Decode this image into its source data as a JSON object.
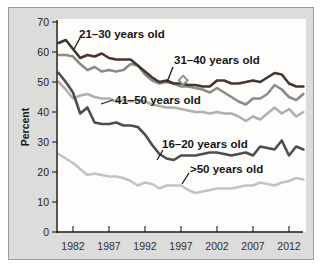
{
  "chart_data": {
    "type": "line",
    "ylabel": "Percent",
    "xlabel": "",
    "xlim": [
      1980,
      2014
    ],
    "ylim": [
      0,
      70
    ],
    "grid": false,
    "legend_position": "inline-annotations",
    "x": [
      1980,
      1981,
      1982,
      1983,
      1984,
      1985,
      1986,
      1987,
      1988,
      1989,
      1990,
      1991,
      1992,
      1993,
      1994,
      1995,
      1996,
      1997,
      1998,
      1999,
      2000,
      2001,
      2002,
      2003,
      2004,
      2005,
      2006,
      2007,
      2008,
      2009,
      2010,
      2011,
      2012,
      2013,
      2014
    ],
    "x_ticks": [
      1982,
      1987,
      1992,
      1997,
      2002,
      2007,
      2012
    ],
    "y_ticks": [
      0,
      10,
      20,
      30,
      40,
      50,
      60,
      70
    ],
    "series": [
      {
        "key": "41-50",
        "name": "41–50 years old",
        "color": "#b0b0ae",
        "values": [
          50,
          47.5,
          44.5,
          45.5,
          46,
          45,
          44.5,
          44.5,
          43.5,
          44,
          43.5,
          44,
          43.5,
          42.5,
          42,
          41.5,
          41.5,
          41,
          40.5,
          40,
          40,
          39.5,
          40,
          39.5,
          39.5,
          38.5,
          37,
          38.5,
          37.5,
          39.5,
          41.5,
          39.5,
          41,
          38.5,
          40
        ]
      },
      {
        "key": "gt-50",
        "name": ">50 years old",
        "color": "#c3c3c1",
        "values": [
          26,
          24.5,
          23,
          21,
          19,
          19.5,
          19,
          18.5,
          18.5,
          18,
          17,
          15.5,
          16.5,
          16,
          14.5,
          15.5,
          15.5,
          15.5,
          14,
          13,
          13.5,
          14,
          14.5,
          14.5,
          14.5,
          15,
          15.5,
          15.5,
          16.5,
          16,
          15.5,
          16.5,
          17,
          18,
          17.5
        ]
      },
      {
        "key": "31-40",
        "name": "31–40 years old",
        "color": "#8b8b89",
        "values": [
          59,
          59,
          58.5,
          56,
          54,
          55,
          53.5,
          54,
          53.5,
          54,
          56,
          55.5,
          52.5,
          50.5,
          49.5,
          50,
          49.5,
          48.5,
          48.5,
          48,
          47.5,
          46.5,
          48,
          46.5,
          45,
          43.5,
          42.5,
          44.5,
          44.5,
          46,
          49,
          47.5,
          45,
          44,
          46
        ]
      },
      {
        "key": "16-20",
        "name": "16–20 years old",
        "color": "#4f4d4c",
        "values": [
          53,
          50,
          46.5,
          39.5,
          41.5,
          36.5,
          36,
          36,
          36.5,
          35.5,
          35.5,
          35,
          32.5,
          29,
          26,
          24.5,
          24,
          25.5,
          25.5,
          25.5,
          26,
          26.5,
          26.5,
          26,
          25.5,
          26,
          26.5,
          25.5,
          28.5,
          28,
          27.5,
          30.5,
          25.5,
          28.5,
          27.5
        ]
      },
      {
        "key": "21-30",
        "name": "21–30 years old",
        "color": "#463432",
        "values": [
          63,
          64,
          61,
          58,
          59,
          58.5,
          59.5,
          58,
          57.5,
          57.5,
          57.5,
          55.5,
          53.5,
          51.5,
          50,
          50.5,
          49.5,
          49.5,
          49,
          49,
          48.5,
          48.5,
          50.5,
          50.5,
          49.5,
          49.5,
          50,
          50.5,
          50,
          51.5,
          53,
          52.5,
          49.5,
          48.5,
          48.5
        ]
      }
    ],
    "annotations": [
      {
        "key": "21-30",
        "text": "21–30 years old",
        "x": 79,
        "y": 28,
        "pointer": [
          74,
          49,
          80,
          38
        ]
      },
      {
        "key": "31-40",
        "text": "31–40 years old",
        "x": 174,
        "y": 54,
        "pointer": [
          167,
          82,
          173,
          67
        ]
      },
      {
        "key": "41-50",
        "text": "41–50 years old",
        "x": 115,
        "y": 94,
        "pointer": [
          101,
          104,
          113,
          100
        ]
      },
      {
        "key": "16-20",
        "text": "16–20 years old",
        "x": 162,
        "y": 138,
        "pointer": [
          157,
          160,
          163,
          150
        ]
      },
      {
        "key": "gt-50",
        "text": ">50 years old",
        "x": 190,
        "y": 163,
        "pointer": [
          182,
          184,
          189,
          173
        ]
      }
    ],
    "marker": {
      "shape": "diamond",
      "year": 1997.3,
      "value": 50.6,
      "fill": "#ffffff",
      "stroke": "#8b8b89"
    },
    "layout": {
      "plot": {
        "left": 57,
        "top": 20,
        "right": 303,
        "bottom": 232
      },
      "x0": 73,
      "px_per_year": 7.2,
      "y0": 232,
      "px_per_unit": 3,
      "axis_color": "#1b1b1b",
      "pointer_color": "#1a1a1a"
    }
  }
}
